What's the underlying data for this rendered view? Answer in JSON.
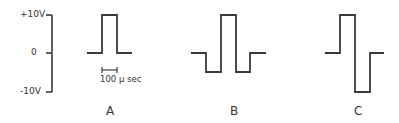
{
  "axis": {
    "ticks": [
      {
        "label": "+10V",
        "value": 10
      },
      {
        "label": "0",
        "value": 0
      },
      {
        "label": "-10V",
        "value": -10
      }
    ]
  },
  "scale_bar": {
    "label": "100 μ sec"
  },
  "panels": [
    {
      "label": "A",
      "description": "single positive pulse to +10V"
    },
    {
      "label": "B",
      "description": "positive pulse to +10V flanked by negative pulses to -5V"
    },
    {
      "label": "C",
      "description": "positive pulse to +10V followed by negative pulse to -10V"
    }
  ],
  "colors": {
    "line": "#3a3a3a"
  }
}
